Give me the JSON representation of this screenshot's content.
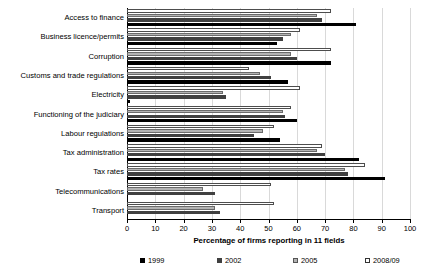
{
  "chart_data": {
    "type": "bar",
    "orientation": "horizontal",
    "title": "",
    "xlabel": "Percentage of firms reporting in 11 fields",
    "ylabel": "",
    "xlim": [
      0,
      100
    ],
    "xticks": [
      0,
      10,
      20,
      30,
      40,
      50,
      60,
      70,
      80,
      90,
      100
    ],
    "grid": true,
    "legend_position": "bottom",
    "categories": [
      "Access to finance",
      "Business licence/permits",
      "Corruption",
      "Customs and trade regulations",
      "Electricity",
      "Functioning of the judiciary",
      "Labour regulations",
      "Tax administration",
      "Tax rates",
      "Telecommunications",
      "Transport"
    ],
    "series": [
      {
        "name": "1999",
        "color": "#000000",
        "values": [
          81,
          53,
          72,
          57,
          1,
          60,
          54,
          82,
          91,
          0,
          0
        ]
      },
      {
        "name": "2002",
        "color": "#404040",
        "values": [
          69,
          55,
          60,
          51,
          35,
          56,
          45,
          70,
          78,
          31,
          33
        ]
      },
      {
        "name": "2005",
        "color": "#b3b3b3",
        "values": [
          67,
          58,
          58,
          47,
          34,
          55,
          48,
          67,
          77,
          27,
          31
        ]
      },
      {
        "name": "2008/09",
        "color": "#ffffff",
        "values": [
          72,
          61,
          72,
          43,
          61,
          58,
          52,
          69,
          84,
          51,
          52
        ]
      }
    ]
  },
  "axis": {
    "x_title": "Percentage of firms reporting in 11 fields",
    "tick_labels": [
      "0",
      "10",
      "20",
      "30",
      "40",
      "50",
      "60",
      "70",
      "80",
      "90",
      "100"
    ]
  },
  "legend": {
    "items": [
      {
        "label": "1999"
      },
      {
        "label": "2002"
      },
      {
        "label": "2005"
      },
      {
        "label": "2008/09"
      }
    ]
  }
}
